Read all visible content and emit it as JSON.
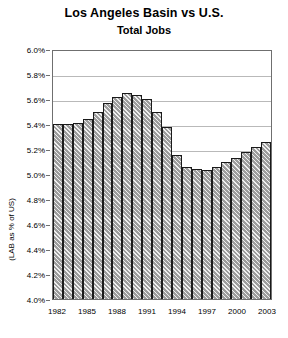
{
  "chart_data": {
    "type": "bar",
    "title": "Los Angeles Basin vs U.S.",
    "subtitle": "Total Jobs",
    "xlabel": "",
    "ylabel": "(LAB as % of US)",
    "ylim": [
      4.0,
      6.0
    ],
    "ytick_step": 0.2,
    "grid": true,
    "legend": "none",
    "ytick_labels": [
      "6.0%",
      "5.8%",
      "5.6%",
      "5.4%",
      "5.2%",
      "5.0%",
      "4.8%",
      "4.6%",
      "4.4%",
      "4.2%",
      "4.0%"
    ],
    "ytick_values": [
      6.0,
      5.8,
      5.6,
      5.4,
      5.2,
      5.0,
      4.8,
      4.6,
      4.4,
      4.2,
      4.0
    ],
    "xtick_labels": [
      "1982",
      "1985",
      "1988",
      "1991",
      "1994",
      "1997",
      "2000",
      "2003"
    ],
    "categories": [
      "1982",
      "1983",
      "1984",
      "1985",
      "1986",
      "1987",
      "1988",
      "1989",
      "1990",
      "1991",
      "1992",
      "1993",
      "1994",
      "1995",
      "1996",
      "1997",
      "1998",
      "1999",
      "2000",
      "2001",
      "2002",
      "2003"
    ],
    "values": [
      5.4,
      5.4,
      5.41,
      5.44,
      5.5,
      5.57,
      5.62,
      5.65,
      5.63,
      5.6,
      5.5,
      5.38,
      5.15,
      5.06,
      5.04,
      5.03,
      5.06,
      5.1,
      5.13,
      5.18,
      5.22,
      5.26
    ],
    "units": "percent"
  }
}
